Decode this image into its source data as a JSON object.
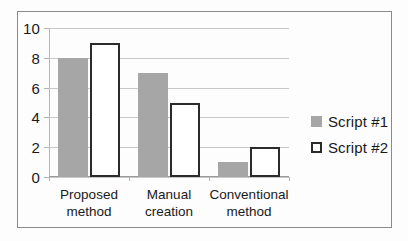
{
  "chart_data": {
    "type": "bar",
    "title": "",
    "xlabel": "",
    "ylabel": "",
    "ylim": [
      0,
      10
    ],
    "yticks": [
      0,
      2,
      4,
      6,
      8,
      10
    ],
    "grid": true,
    "legend_position": "right",
    "categories": [
      "Proposed\nmethod",
      "Manual\ncreation",
      "Conventional\nmethod"
    ],
    "category_lines": [
      [
        "Proposed",
        "method"
      ],
      [
        "Manual",
        "creation"
      ],
      [
        "Conventional",
        "method"
      ]
    ],
    "series": [
      {
        "name": "Script #1",
        "values": [
          8,
          7,
          1
        ],
        "color": "#a6a6a6",
        "style": "filled"
      },
      {
        "name": "Script #2",
        "values": [
          9,
          5,
          2
        ],
        "color": "#ffffff",
        "style": "outlined",
        "border_color": "#2b2b2b"
      }
    ]
  },
  "axis": {
    "ytick_labels": [
      "0",
      "2",
      "4",
      "6",
      "8",
      "10"
    ]
  },
  "legend": {
    "items": [
      {
        "label": "Script #1"
      },
      {
        "label": "Script #2"
      }
    ]
  }
}
